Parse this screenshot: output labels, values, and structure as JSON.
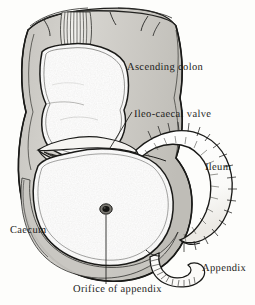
{
  "figure": {
    "style": "line-drawing",
    "background_color": "#fdfdfb",
    "ink_color": "#1a1a18",
    "wall_fill_color": "#cfcdc8",
    "lumen_fill_color": "#fbfbf9"
  },
  "labels": {
    "ascending_colon": "Ascending colon",
    "ileocaecal_valve": "Ileo-caecal valve",
    "ileum": "Ileum",
    "caecum": "Caecum",
    "appendix": "Appendix",
    "orifice_of_appendix": "Orifice of appendix"
  },
  "structures": [
    {
      "name": "ascending-colon",
      "label": "Ascending colon",
      "description": "Upper opened segment of large bowel with haustral scalloped inner lumen and a cut taenia coli strip at the top"
    },
    {
      "name": "caecum",
      "label": "Caecum",
      "description": "Large rounded blind pouch forming the lower part of the drawing, wall cut away to reveal the smooth interior"
    },
    {
      "name": "ileo-caecal-valve",
      "label": "Ileo-caecal valve",
      "description": "Transverse lip-like slit opening between the ileum and the caecum"
    },
    {
      "name": "ileum",
      "label": "Ileum",
      "description": "Curved tube of small bowel entering the caecum from the right, drawn with short hatch strokes along both margins"
    },
    {
      "name": "appendix",
      "label": "Appendix",
      "description": "Narrow worm-like tube arising from the lower right of the caecum, drawn with fine hatching"
    },
    {
      "name": "orifice-of-appendix",
      "label": "Orifice of appendix",
      "description": "Small dark round opening on the interior posteromedial wall of the caecum"
    }
  ],
  "leader_lines": [
    {
      "name": "ileocaecal-valve-leader",
      "from_label": "Ileo-caecal valve",
      "to_structure": "ileo-caecal-valve"
    },
    {
      "name": "orifice-of-appendix-leader",
      "from_label": "Orifice of appendix",
      "to_structure": "orifice-of-appendix"
    }
  ]
}
